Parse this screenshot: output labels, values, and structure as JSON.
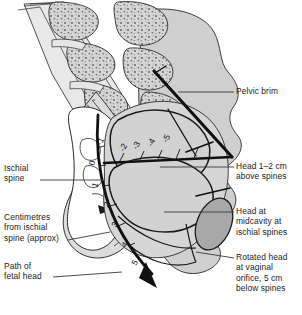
{
  "figure": {
    "background_color": "#ffffff",
    "bone_fill": "#d9d9d9",
    "soft_tissue_fill": "#cfcfcf",
    "head_fill": "#d2d2d2",
    "rotated_head_fill": "#a8a8a8",
    "line_color": "#1a1a1a"
  },
  "labels": {
    "pelvic_brim": "Pelvic brim",
    "head_above_spines": "Head 1–2 cm\nabove spines",
    "head_midcavity": "Head at\nmidcavity at\nischial spines",
    "rotated_head": "Rotated head\nat vaginal\norifice, 5 cm\nbelow spines",
    "ischial_spine": "Ischial\nspine",
    "centimetres": "Centimetres\nfrom ischial\nspine (approx)",
    "path_of_fetal_head": "Path of\nfetal head"
  },
  "scale": {
    "caption": "Centimetres from ischial spine (approx)",
    "above_spines": [
      "-5",
      "-4",
      "-3",
      "-2",
      "-1"
    ],
    "at_spines": [
      "0"
    ],
    "below_spines": [
      "1",
      "2",
      "3",
      "4",
      "5"
    ]
  }
}
